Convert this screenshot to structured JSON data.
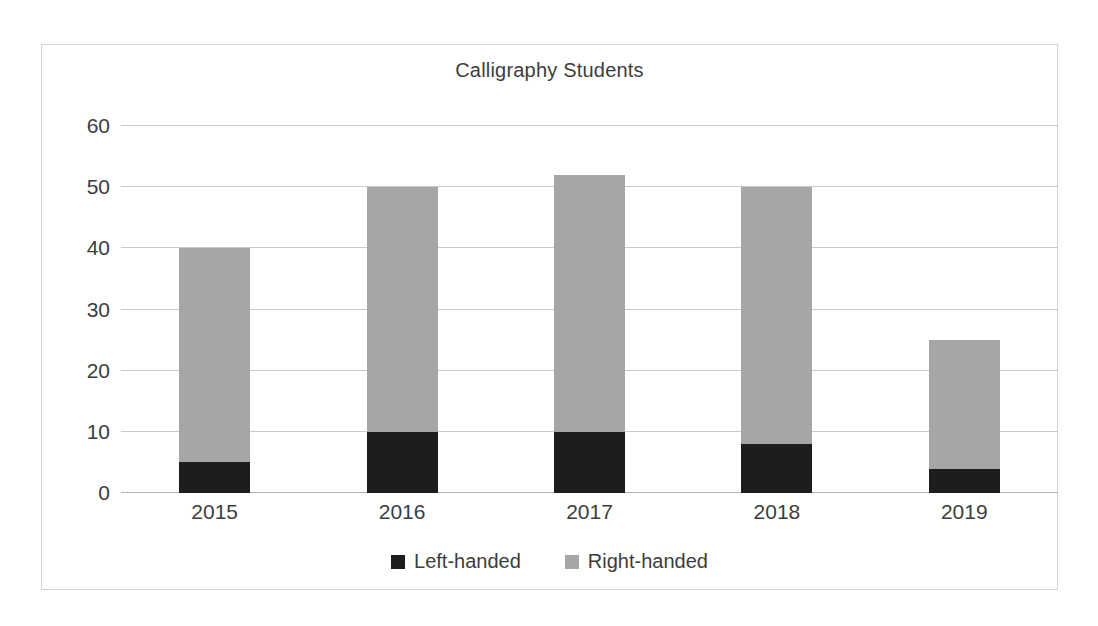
{
  "chart_data": {
    "type": "bar",
    "subtype": "stacked-column",
    "title": "Calligraphy Students",
    "xlabel": "",
    "ylabel": "",
    "categories": [
      "2015",
      "2016",
      "2017",
      "2018",
      "2019"
    ],
    "series": [
      {
        "name": "Left-handed",
        "color": "#1d1d1d",
        "values": [
          5,
          10,
          10,
          8,
          4
        ]
      },
      {
        "name": "Right-handed",
        "color": "#a6a6a6",
        "values": [
          35,
          40,
          42,
          42,
          21
        ]
      }
    ],
    "totals": [
      40,
      50,
      52,
      50,
      25
    ],
    "ylim": [
      0,
      60
    ],
    "yticks": [
      "0",
      "10",
      "20",
      "30",
      "40",
      "50",
      "60"
    ],
    "ytick_values": [
      0,
      10,
      20,
      30,
      40,
      50,
      60
    ],
    "grid": true,
    "legend_position": "bottom",
    "gridline_color": "#c9c9c9",
    "border_color": "#d4d4d4",
    "background": "#ffffff",
    "text_color": "#3d3d3d"
  }
}
